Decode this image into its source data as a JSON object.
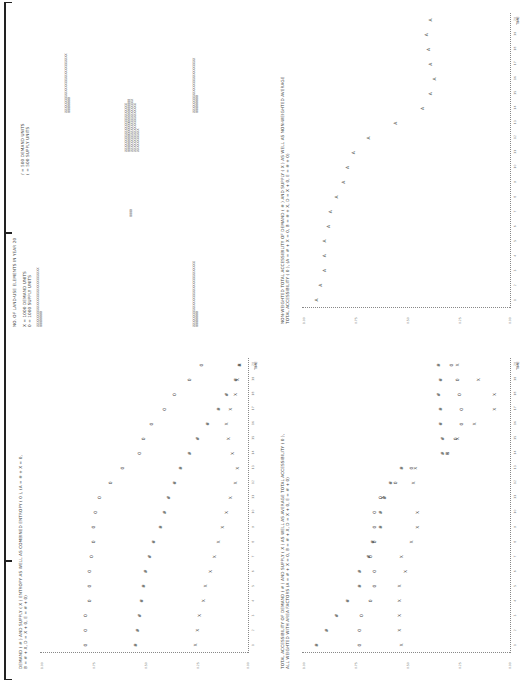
{
  "page": {
    "orientation": "rotated-90",
    "frame_color": "#222222"
  },
  "panels": {
    "land_use": {
      "title": "NO. OF LAND-USE ELEMENTS IN YEAR 20",
      "legend_left": [
        "X = 1000 DEMAND UNITS",
        "0 = 1000 SUPPLY UNITS"
      ],
      "legend_right": [
        "/ = 500 DEMAND UNITS",
        "( = 500 SUPPLY UNITS"
      ],
      "rows": [
        {
          "demand": "XXXXXXXXXXXXXXXXXXXXXXXXXXXX",
          "supply": "00000000"
        },
        {
          "demand": "XXXXXXXXXXXXXXXXXXXXXXXXXXXX",
          "supply": "00000000"
        },
        {
          "demand": "0000",
          "supply": ""
        },
        {
          "demand": "XXXXXXXXXXXXXXXXXXXXXXX",
          "supply": "000000000000000000000000000"
        },
        {
          "demand": "XXXXXXXXXXXXXXXXXXXXXXXXXXXXXXX",
          "supply": "000000000"
        }
      ]
    },
    "non_weighted": {
      "title_line1": "NON-WEIGHTED TOTAL ACCESSIBILITY OF DEMAND ( # ) AND SUPPLY ( X ) AS WELL AS NON-WEIGHTED AVERAGE",
      "title_line2": "TOTAL ACCESSIBILITY ( 0 ),  (A = # + X = 0,  B = # + X,  D = X + 0,  E = # + 0)",
      "x_label": "TIME",
      "y_ticks": [
        "1.00",
        "0.75",
        "0.50",
        "0.25",
        "0.00"
      ],
      "x_ticks": [
        "1",
        "2",
        "3",
        "4",
        "5",
        "6",
        "7",
        "8",
        "9",
        "10",
        "11",
        "12",
        "13",
        "14",
        "15",
        "16",
        "17",
        "18",
        "19",
        "20"
      ]
    },
    "entropy": {
      "title_line1": "DEMAND ( # ) AND SUPPLY ( X ) ENTROPY AS WELL AS COMBINED ENTROPY ( 0 ),  (A = # + X = 0,",
      "title_line2": "B = # + X,  D = X + 0,  E = # + 0)",
      "x_label": "TIME",
      "y_ticks": [
        "1.00",
        "0.75",
        "0.50",
        "0.25",
        "0.00"
      ],
      "x_ticks": [
        "1",
        "2",
        "3",
        "4",
        "5",
        "6",
        "7",
        "8",
        "9",
        "10",
        "11",
        "12",
        "13",
        "14",
        "15",
        "16",
        "17",
        "18",
        "19",
        "20"
      ]
    },
    "weighted": {
      "title_line1": "TOTAL ACCESSIBILITY OF DEMAND ( # ) AND SUPPLY ( X ) AS WELL AS AVERAGE TOTAL ACCESSIBILITY ( 0 ),",
      "title_line2": "ALL WEIGHTED WITH AREA FACTORS (A = # + X = 0,  B = # + X,  D = X + 0,  E = # + 0)",
      "x_label": "TIME",
      "y_ticks": [
        "1.00",
        "0.75",
        "0.50",
        "0.25",
        "0.00"
      ],
      "x_ticks": [
        "1",
        "2",
        "3",
        "4",
        "5",
        "6",
        "7",
        "8",
        "9",
        "10",
        "11",
        "12",
        "13",
        "14",
        "15",
        "16",
        "17",
        "18",
        "19",
        "20"
      ]
    }
  },
  "chart_data": [
    {
      "type": "scatter",
      "title": "Non-weighted total accessibility of demand (#) and supply (X) as well as non-weighted average total accessibility (0)",
      "xlabel": "TIME",
      "ylabel": "",
      "ylim": [
        0,
        1
      ],
      "x": [
        1,
        2,
        3,
        4,
        5,
        6,
        7,
        8,
        9,
        10,
        11,
        12,
        13,
        14,
        15,
        16,
        17,
        18,
        19,
        20
      ],
      "series": [
        {
          "name": "A (# = X = 0)",
          "values": [
            0.93,
            0.91,
            0.89,
            0.89,
            0.89,
            0.87,
            0.86,
            0.83,
            0.8,
            0.78,
            0.75,
            0.68,
            0.55,
            0.42,
            0.38,
            0.36,
            0.38,
            0.39,
            0.4,
            0.38
          ]
        }
      ]
    },
    {
      "type": "scatter",
      "title": "Demand (#) and supply (X) entropy as well as combined entropy (0)",
      "xlabel": "TIME",
      "ylabel": "",
      "ylim": [
        0,
        1
      ],
      "x": [
        1,
        2,
        3,
        4,
        5,
        6,
        7,
        8,
        9,
        10,
        11,
        12,
        13,
        14,
        15,
        16,
        17,
        18,
        19,
        20
      ],
      "series": [
        {
          "name": "Combined entropy (0)",
          "values": [
            0.78,
            0.78,
            0.78,
            0.76,
            0.76,
            0.76,
            0.75,
            0.74,
            0.74,
            0.73,
            0.71,
            0.66,
            0.6,
            0.52,
            0.5,
            0.46,
            0.4,
            0.35,
            0.28,
            0.22,
            0.18
          ]
        },
        {
          "name": "Demand entropy (#)",
          "values": [
            0.54,
            0.53,
            0.52,
            0.51,
            0.5,
            0.49,
            0.47,
            0.45,
            0.42,
            0.4,
            0.38,
            0.35,
            0.32,
            0.28,
            0.24,
            0.19,
            0.14,
            0.1,
            0.06,
            0.04
          ]
        },
        {
          "name": "Supply entropy (X)",
          "values": [
            0.25,
            0.24,
            0.23,
            0.21,
            0.2,
            0.18,
            0.16,
            0.14,
            0.12,
            0.1,
            0.08,
            0.06,
            0.05,
            0.07,
            0.09,
            0.1,
            0.08,
            0.06,
            0.05,
            0.04
          ]
        }
      ]
    },
    {
      "type": "scatter",
      "title": "Total accessibility of demand (#) and supply (X) as well as average total accessibility (0), all weighted with area factors",
      "xlabel": "TIME",
      "ylabel": "",
      "ylim": [
        0,
        1
      ],
      "x": [
        1,
        2,
        3,
        4,
        5,
        6,
        7,
        8,
        9,
        10,
        11,
        12,
        13,
        14,
        15,
        16,
        17,
        18,
        19,
        20
      ],
      "series": [
        {
          "name": "Demand (#)",
          "values": [
            0.93,
            0.88,
            0.83,
            0.78,
            0.72,
            0.72,
            0.68,
            0.66,
            0.62,
            0.62,
            0.6,
            0.57,
            0.52,
            0.32,
            0.32,
            0.33,
            0.33,
            0.34,
            0.33,
            0.34
          ]
        },
        {
          "name": "Average (0)",
          "values": [
            0.72,
            0.72,
            0.71,
            0.67,
            0.65,
            0.65,
            0.67,
            0.65,
            0.65,
            0.65,
            0.62,
            0.55,
            0.47,
            0.3,
            0.26,
            0.23,
            0.23,
            0.24,
            0.25,
            0.28
          ]
        },
        {
          "name": "Supply (X)",
          "values": [
            0.52,
            0.53,
            0.53,
            0.53,
            0.53,
            0.5,
            0.52,
            0.47,
            0.44,
            0.44,
            0.61,
            0.46,
            0.45,
            0.3,
            0.25,
            0.17,
            0.07,
            0.07,
            0.15,
            0.25
          ]
        }
      ]
    }
  ]
}
